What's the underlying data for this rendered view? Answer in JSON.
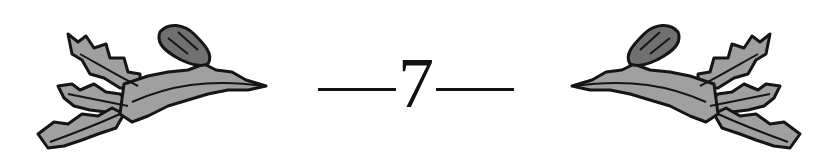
{
  "chapter": {
    "number": "7",
    "ornament_left": "leafy-branch-with-acorn",
    "ornament_right": "leafy-branch-with-acorn-mirrored"
  },
  "colors": {
    "ink": "#111111",
    "leaf_fill": "#9a9a9a",
    "background": "#ffffff"
  }
}
